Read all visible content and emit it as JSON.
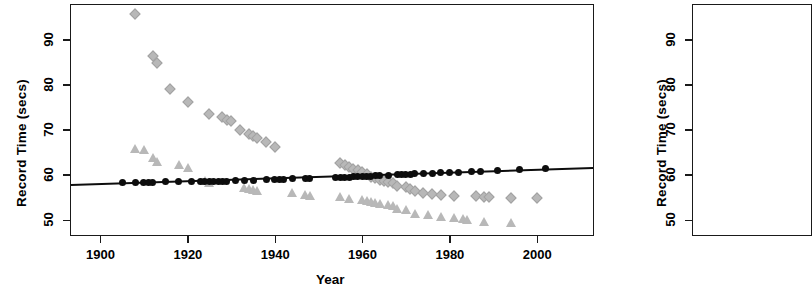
{
  "figure": {
    "panel_count": 2,
    "note_visible_panels": "second panel only partially visible at right edge"
  },
  "panel1": {
    "ylabel": "Record Time (secs)",
    "xlabel": "Year",
    "ytick_labels": [
      "50",
      "60",
      "70",
      "80",
      "90"
    ],
    "xtick_labels": [
      "1900",
      "1920",
      "1940",
      "1960",
      "1980",
      "2000"
    ]
  },
  "panel2": {
    "ylabel": "Record Time (secs)",
    "ytick_labels": [
      "50",
      "60",
      "70",
      "80",
      "90"
    ]
  },
  "colors": {
    "marker_gray": "#b8b8b8",
    "marker_black": "#0d0d0d",
    "axis": "#1a1a1a",
    "background": "#ffffff"
  },
  "chart_data": {
    "type": "scatter",
    "title": "",
    "xlabel": "Year",
    "ylabel": "Record Time (secs)",
    "xlim": [
      1893,
      2013
    ],
    "ylim": [
      46.5,
      98
    ],
    "xticks": [
      1900,
      1920,
      1940,
      1960,
      1980,
      2000
    ],
    "yticks": [
      50,
      60,
      70,
      80,
      90
    ],
    "grid": false,
    "legend": "none",
    "series": [
      {
        "name": "gray-diamonds",
        "marker": "diamond",
        "color": "#b8b8b8",
        "points": [
          [
            1908,
            95.6
          ],
          [
            1912,
            86.4
          ],
          [
            1913,
            84.8
          ],
          [
            1916,
            79.0
          ],
          [
            1920,
            76.2
          ],
          [
            1925,
            73.4
          ],
          [
            1928,
            72.8
          ],
          [
            1929,
            72.2
          ],
          [
            1930,
            71.9
          ],
          [
            1932,
            70.0
          ],
          [
            1934,
            69.0
          ],
          [
            1935,
            68.6
          ],
          [
            1936,
            68.2
          ],
          [
            1938,
            67.3
          ],
          [
            1940,
            66.1
          ],
          [
            1955,
            62.6
          ],
          [
            1956,
            62.1
          ],
          [
            1957,
            61.7
          ],
          [
            1958,
            61.3
          ],
          [
            1959,
            61.0
          ],
          [
            1960,
            60.6
          ],
          [
            1961,
            60.2
          ],
          [
            1962,
            59.6
          ],
          [
            1963,
            59.2
          ],
          [
            1964,
            58.9
          ],
          [
            1965,
            58.6
          ],
          [
            1966,
            58.4
          ],
          [
            1967,
            58.1
          ],
          [
            1968,
            57.6
          ],
          [
            1970,
            57.2
          ],
          [
            1971,
            56.9
          ],
          [
            1972,
            56.3
          ],
          [
            1974,
            56.0
          ],
          [
            1976,
            55.7
          ],
          [
            1978,
            55.5
          ],
          [
            1981,
            55.4
          ],
          [
            1986,
            55.2
          ],
          [
            1988,
            55.1
          ],
          [
            1989,
            55.0
          ],
          [
            1994,
            54.9
          ],
          [
            2000,
            54.8
          ]
        ]
      },
      {
        "name": "gray-triangles",
        "marker": "triangle",
        "color": "#b8b8b8",
        "points": [
          [
            1908,
            65.8
          ],
          [
            1910,
            65.6
          ],
          [
            1912,
            63.8
          ],
          [
            1913,
            62.9
          ],
          [
            1918,
            62.2
          ],
          [
            1920,
            61.6
          ],
          [
            1924,
            58.6
          ],
          [
            1925,
            58.2
          ],
          [
            1933,
            57.1
          ],
          [
            1934,
            56.9
          ],
          [
            1935,
            56.6
          ],
          [
            1936,
            56.4
          ],
          [
            1944,
            55.9
          ],
          [
            1947,
            55.6
          ],
          [
            1948,
            55.4
          ],
          [
            1955,
            55.0
          ],
          [
            1957,
            54.6
          ],
          [
            1960,
            54.4
          ],
          [
            1961,
            54.2
          ],
          [
            1962,
            54.0
          ],
          [
            1963,
            53.8
          ],
          [
            1964,
            53.6
          ],
          [
            1966,
            53.4
          ],
          [
            1967,
            53.1
          ],
          [
            1968,
            52.4
          ],
          [
            1970,
            52.2
          ],
          [
            1972,
            51.2
          ],
          [
            1975,
            51.0
          ],
          [
            1978,
            50.6
          ],
          [
            1981,
            50.3
          ],
          [
            1983,
            50.2
          ],
          [
            1984,
            50.0
          ],
          [
            1988,
            49.6
          ],
          [
            1994,
            49.4
          ]
        ]
      },
      {
        "name": "black-circles-with-fit",
        "marker": "circle",
        "color": "#0d0d0d",
        "has_fit_line": true,
        "fit_line": {
          "x1": 1893,
          "y1": 57.8,
          "x2": 2013,
          "y2": 61.6
        },
        "points": [
          [
            1905,
            58.2
          ],
          [
            1908,
            58.2
          ],
          [
            1910,
            58.3
          ],
          [
            1911,
            58.3
          ],
          [
            1912,
            58.3
          ],
          [
            1915,
            58.4
          ],
          [
            1918,
            58.4
          ],
          [
            1921,
            58.5
          ],
          [
            1923,
            58.5
          ],
          [
            1924,
            58.5
          ],
          [
            1925,
            58.5
          ],
          [
            1926,
            58.6
          ],
          [
            1927,
            58.6
          ],
          [
            1928,
            58.6
          ],
          [
            1929,
            58.6
          ],
          [
            1931,
            58.7
          ],
          [
            1933,
            58.8
          ],
          [
            1935,
            58.8
          ],
          [
            1938,
            58.9
          ],
          [
            1940,
            58.9
          ],
          [
            1941,
            59.0
          ],
          [
            1942,
            59.0
          ],
          [
            1944,
            59.1
          ],
          [
            1947,
            59.2
          ],
          [
            1948,
            59.2
          ],
          [
            1954,
            59.4
          ],
          [
            1955,
            59.5
          ],
          [
            1956,
            59.5
          ],
          [
            1957,
            59.5
          ],
          [
            1958,
            59.6
          ],
          [
            1959,
            59.6
          ],
          [
            1960,
            59.6
          ],
          [
            1961,
            59.7
          ],
          [
            1962,
            59.7
          ],
          [
            1963,
            59.8
          ],
          [
            1964,
            59.8
          ],
          [
            1966,
            59.9
          ],
          [
            1968,
            60.0
          ],
          [
            1969,
            60.0
          ],
          [
            1970,
            60.1
          ],
          [
            1971,
            60.1
          ],
          [
            1972,
            60.2
          ],
          [
            1974,
            60.3
          ],
          [
            1976,
            60.3
          ],
          [
            1978,
            60.4
          ],
          [
            1980,
            60.5
          ],
          [
            1982,
            60.6
          ],
          [
            1985,
            60.7
          ],
          [
            1987,
            60.8
          ],
          [
            1991,
            60.9
          ],
          [
            1996,
            61.1
          ],
          [
            2002,
            61.3
          ]
        ]
      }
    ]
  }
}
